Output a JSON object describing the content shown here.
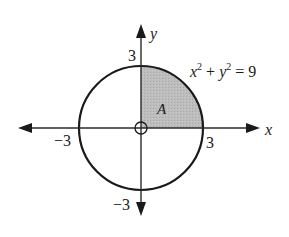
{
  "diagram": {
    "axes": {
      "x_label": "x",
      "y_label": "y"
    },
    "ticks": {
      "x_pos": "3",
      "x_neg": "−3",
      "y_pos": "3",
      "y_neg": "−3"
    },
    "equation": {
      "x": "x",
      "sup1": "2",
      "plus": " + ",
      "y": "y",
      "sup2": "2",
      "eq": " = 9"
    },
    "region_label": "A",
    "circle_radius": 3,
    "shaded_quadrant": "first",
    "colors": {
      "stroke": "#1a1a1a",
      "shade": "#b8b8b8"
    }
  }
}
